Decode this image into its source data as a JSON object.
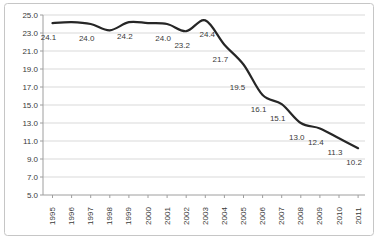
{
  "window": {
    "title": "",
    "background": "#ffffff"
  },
  "chart_data": {
    "type": "line",
    "title": "",
    "xlabel": "",
    "ylabel": "",
    "x_labels": [
      "1995",
      "1996",
      "1997",
      "1998",
      "1999",
      "2000",
      "2001",
      "2002",
      "2003",
      "2004",
      "2005",
      "2006",
      "2007",
      "2008",
      "2009",
      "2010",
      "2011"
    ],
    "series": [
      {
        "name": "series-1",
        "values": [
          24.1,
          24.2,
          24.0,
          23.3,
          24.2,
          24.1,
          24.0,
          23.2,
          24.4,
          21.7,
          19.5,
          16.1,
          15.1,
          13.0,
          12.4,
          11.3,
          10.2
        ]
      }
    ],
    "visible_point_labels": [
      "24.1",
      null,
      "24.0",
      null,
      "24.2",
      null,
      "24.0",
      "23.2",
      "24.4",
      "21.7",
      "19.5",
      "16.1",
      "15.1",
      "13.0",
      "12.4",
      "11.3",
      "10.2"
    ],
    "y_ticks": [
      "25.0",
      "23.0",
      "21.0",
      "19.0",
      "17.0",
      "15.0",
      "13.0",
      "11.0",
      "9.0",
      "7.0",
      "5.0"
    ],
    "ylim": [
      5,
      25
    ],
    "y_step": 2,
    "grid": "horizontal",
    "legend": "none",
    "smoothed_line": true,
    "x_label_rotation_deg": -90,
    "colors": {
      "line": "#262626",
      "grid": "#d9d9d9",
      "axis": "#9e9e9e",
      "text": "#3a3a3a",
      "border": "#c6c6c6",
      "background": "#ffffff"
    }
  }
}
